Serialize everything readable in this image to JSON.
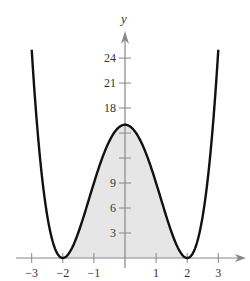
{
  "chart_data": {
    "type": "line",
    "title": "",
    "xlabel": "",
    "ylabel": "y",
    "function": "y = (x^2 - 4)^2 = x^4 - 8x^2 + 16",
    "x": [
      -3,
      -2.75,
      -2.5,
      -2.25,
      -2,
      -1.75,
      -1.5,
      -1.25,
      -1,
      -0.75,
      -0.5,
      -0.25,
      0,
      0.25,
      0.5,
      0.75,
      1,
      1.25,
      1.5,
      1.75,
      2,
      2.25,
      2.5,
      2.75,
      3
    ],
    "series": [
      {
        "name": "curve",
        "values": [
          25,
          12.5,
          5.06,
          1.13,
          0,
          0.88,
          3.06,
          5.88,
          9,
          11.88,
          14.06,
          15.5,
          16,
          15.5,
          14.06,
          11.88,
          9,
          5.88,
          3.06,
          0.88,
          0,
          1.13,
          5.06,
          12.5,
          25
        ]
      }
    ],
    "shaded_region": {
      "x_from": -2,
      "x_to": 2,
      "between": "curve and x-axis",
      "color": "#e6e6e6"
    },
    "xlim": [
      -3.3,
      3.9
    ],
    "ylim": [
      0,
      27
    ],
    "x_ticks": [
      -3,
      -2,
      -1,
      1,
      2,
      3
    ],
    "x_tick_labels": [
      "−3",
      "−2",
      "−1",
      "1",
      "2",
      "3"
    ],
    "y_ticks": [
      3,
      6,
      9,
      12,
      15,
      18,
      21,
      24
    ],
    "y_tick_labels": [
      "3",
      "6",
      "9",
      "",
      "",
      "18",
      "21",
      "24"
    ],
    "grid": false,
    "legend": null,
    "colors": {
      "curve": "#111111",
      "axis": "#888888",
      "fill": "#e6e6e6"
    }
  }
}
